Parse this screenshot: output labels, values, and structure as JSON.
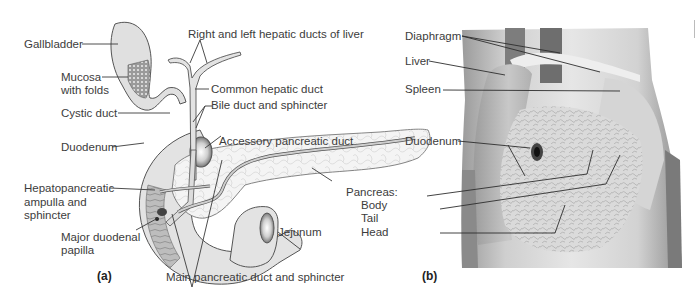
{
  "figure": {
    "panel_a": {
      "tag": "(a)",
      "labels": {
        "gallbladder": "Gallbladder",
        "mucosa_line1": "Mucosa",
        "mucosa_line2": "with folds",
        "cystic_duct": "Cystic duct",
        "duodenum": "Duodenum",
        "hepato_line1": "Hepatopancreatic",
        "hepato_line2": "ampulla and",
        "hepato_line3": "sphincter",
        "papilla_line1": "Major duodenal",
        "papilla_line2": "papilla",
        "hepatic_ducts": "Right and left hepatic ducts of liver",
        "common_hepatic": "Common hepatic duct",
        "bile_duct": "Bile duct and sphincter",
        "accessory_duct": "Accessory pancreatic duct",
        "pancreas": "Pancreas:",
        "body": "Body",
        "tail": "Tail",
        "head": "Head",
        "jejunum": "Jejunum",
        "main_duct": "Main pancreatic duct and sphincter"
      }
    },
    "panel_b": {
      "tag": "(b)",
      "labels": {
        "diaphragm": "Diaphragm",
        "liver": "Liver",
        "spleen": "Spleen",
        "duodenum": "Duodenum"
      }
    },
    "colors": {
      "organ_fill": "#e4e4e4",
      "pancreas_fill": "#f1f1f1",
      "outline": "#555555",
      "leader": "#3a3a3a",
      "photo_bg": "#bdbdbd"
    }
  }
}
